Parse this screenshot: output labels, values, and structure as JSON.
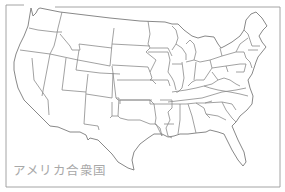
{
  "map": {
    "title": "アメリカ合衆国",
    "region": "United States (contiguous 48 states)",
    "style": "outline map with state borders",
    "colors": {
      "background": "#ffffff",
      "border_stroke": "#8a8a8a",
      "label": "#a8a8a8"
    }
  }
}
